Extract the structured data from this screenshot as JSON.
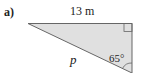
{
  "question": {
    "part_label": "a)"
  },
  "triangle": {
    "fill_color": "#e0e0e0",
    "stroke_color": "#666666",
    "sides": {
      "top": "13 m",
      "hypotenuse": "p"
    },
    "angles": {
      "bottom_right": "65°",
      "top_right": "right angle"
    }
  }
}
